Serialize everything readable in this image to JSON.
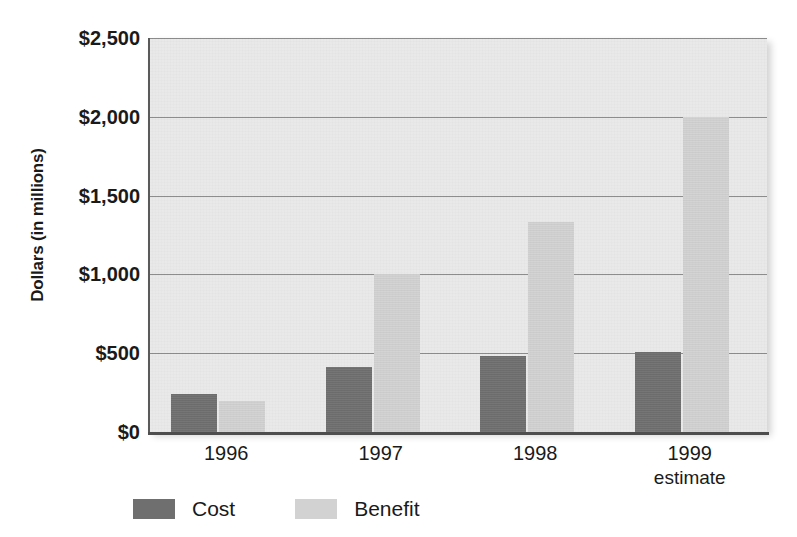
{
  "chart_data": {
    "type": "bar",
    "title": "",
    "subtitle": "",
    "xlabel": "",
    "ylabel": "Dollars (in millions)",
    "categories": [
      "1996",
      "1997",
      "1998",
      "1999"
    ],
    "category_sublabels": [
      "",
      "",
      "",
      "estimate"
    ],
    "series": [
      {
        "name": "Cost",
        "values": [
          240,
          415,
          485,
          510
        ],
        "color": "#6f6f6f"
      },
      {
        "name": "Benefit",
        "values": [
          195,
          1000,
          1330,
          2000
        ],
        "color": "#d2d2d2"
      }
    ],
    "ylim": [
      0,
      2500
    ],
    "ytick_values": [
      0,
      500,
      1000,
      1500,
      2000,
      2500
    ],
    "ytick_labels": [
      "$0",
      "$500",
      "$1,000",
      "$1,500",
      "$2,000",
      "$2,500"
    ],
    "grid": true,
    "grid_axis": "y",
    "legend_position": "bottom-left",
    "plot_background": "#e9e9e9",
    "gridline_color": "#8d8d8d",
    "axis_color": "#4e4e4e"
  },
  "axes": {
    "y_title": "Dollars (in millions)",
    "y_ticks": [
      {
        "label": "$2,500",
        "value": 2500
      },
      {
        "label": "$2,000",
        "value": 2000
      },
      {
        "label": "$1,500",
        "value": 1500
      },
      {
        "label": "$1,000",
        "value": 1000
      },
      {
        "label": "$500",
        "value": 500
      },
      {
        "label": "$0",
        "value": 0
      }
    ],
    "x_ticks": [
      {
        "label": "1996",
        "sub": ""
      },
      {
        "label": "1997",
        "sub": ""
      },
      {
        "label": "1998",
        "sub": ""
      },
      {
        "label": "1999",
        "sub": "estimate"
      }
    ]
  },
  "legend": {
    "items": [
      {
        "label": "Cost",
        "color": "#6f6f6f"
      },
      {
        "label": "Benefit",
        "color": "#d2d2d2"
      }
    ]
  }
}
